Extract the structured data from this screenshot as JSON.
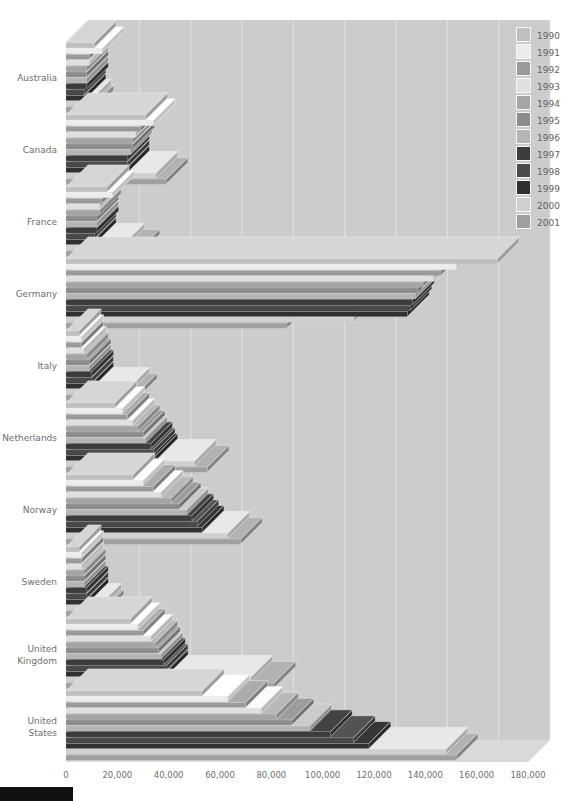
{
  "chart_data": {
    "type": "bar",
    "orientation": "horizontal",
    "style": "3d-grouped-horizontal-bars",
    "title": "",
    "subtitle": "",
    "xlabel": "",
    "ylabel": "",
    "xlim": [
      0,
      180000
    ],
    "xticks": [
      0,
      20000,
      40000,
      60000,
      80000,
      100000,
      120000,
      140000,
      160000,
      180000
    ],
    "xtick_labels": [
      "0",
      "20,000",
      "40,000",
      "60,000",
      "80,000",
      "100,000",
      "120,000",
      "140,000",
      "160,000",
      "180,000"
    ],
    "grid": true,
    "grid_axis": "x",
    "legend_position": "top-right",
    "categories": [
      "Australia",
      "Canada",
      "France",
      "Germany",
      "Italy",
      "Netherlands",
      "Norway",
      "Sweden",
      "United Kingdom",
      "United States"
    ],
    "series": [
      {
        "name": "1990",
        "color": "#bfbfbf",
        "values": [
          11000,
          31000,
          16000,
          168000,
          5000,
          19000,
          26000,
          5000,
          25000,
          53000
        ]
      },
      {
        "name": "1991",
        "color": "#ececec",
        "values": [
          14000,
          34000,
          18000,
          152000,
          6000,
          22000,
          30000,
          6000,
          28000,
          63000
        ]
      },
      {
        "name": "1992",
        "color": "#9a9a9a",
        "values": [
          9000,
          29000,
          14000,
          146000,
          6000,
          24000,
          34000,
          6000,
          30000,
          70000
        ]
      },
      {
        "name": "1993",
        "color": "#e0e0e0",
        "values": [
          9000,
          27000,
          13000,
          143000,
          7000,
          26000,
          37000,
          6000,
          33000,
          76000
        ]
      },
      {
        "name": "1994",
        "color": "#a5a5a5",
        "values": [
          8000,
          26000,
          13000,
          139000,
          8000,
          28000,
          41000,
          7000,
          35000,
          82000
        ]
      },
      {
        "name": "1995",
        "color": "#8c8c8c",
        "values": [
          8000,
          26000,
          12000,
          137000,
          9000,
          30000,
          44000,
          7000,
          36000,
          88000
        ]
      },
      {
        "name": "1996",
        "color": "#b5b5b5",
        "values": [
          8000,
          25000,
          12000,
          136000,
          9000,
          31000,
          47000,
          7000,
          37000,
          95000
        ]
      },
      {
        "name": "1997",
        "color": "#3c3c3c",
        "values": [
          8000,
          24000,
          12000,
          135000,
          10000,
          33000,
          49000,
          8000,
          38000,
          103000
        ]
      },
      {
        "name": "1998",
        "color": "#4a4a4a",
        "values": [
          7000,
          24000,
          11000,
          134000,
          10000,
          34000,
          51000,
          8000,
          39000,
          112000
        ]
      },
      {
        "name": "1999",
        "color": "#303030",
        "values": [
          7000,
          24000,
          11000,
          133000,
          10000,
          35000,
          53000,
          8000,
          39000,
          118000
        ]
      },
      {
        "name": "2000",
        "color": "#cfcfcf",
        "values": [
          9000,
          35000,
          22000,
          112000,
          24000,
          50000,
          63000,
          13000,
          72000,
          148000
        ]
      },
      {
        "name": "2001",
        "color": "#9f9f9f",
        "values": [
          10000,
          39000,
          28000,
          86000,
          27000,
          55000,
          68000,
          14000,
          81000,
          152000
        ]
      }
    ],
    "legend": [
      {
        "label": "1990",
        "color": "#bfbfbf"
      },
      {
        "label": "1991",
        "color": "#ececec"
      },
      {
        "label": "1992",
        "color": "#9a9a9a"
      },
      {
        "label": "1993",
        "color": "#e0e0e0"
      },
      {
        "label": "1994",
        "color": "#a5a5a5"
      },
      {
        "label": "1995",
        "color": "#8c8c8c"
      },
      {
        "label": "1996",
        "color": "#b5b5b5"
      },
      {
        "label": "1997",
        "color": "#3c3c3c"
      },
      {
        "label": "1998",
        "color": "#4a4a4a"
      },
      {
        "label": "1999",
        "color": "#303030"
      },
      {
        "label": "2000",
        "color": "#cfcfcf"
      },
      {
        "label": "2001",
        "color": "#9f9f9f"
      }
    ],
    "colors": {
      "plot_background": "#cccccc",
      "page_background": "#ffffff",
      "gridline": "#e2e2e2",
      "axis_text": "#6d6d6d",
      "wall_side": "#c3c3c3",
      "wall_top": "#d9d9d9",
      "footer_bar": "#111111"
    }
  }
}
